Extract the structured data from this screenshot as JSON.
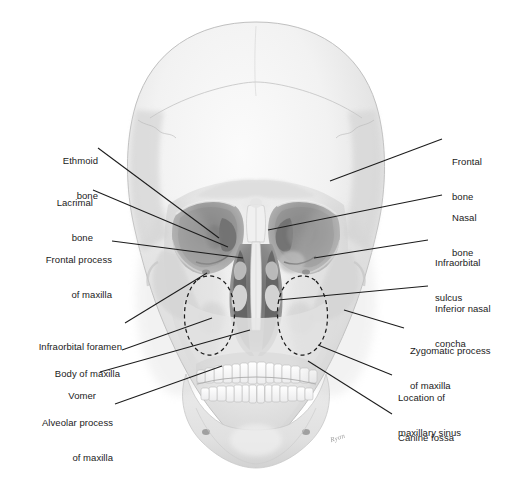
{
  "figure": {
    "background_color": "#ffffff",
    "text_color": "#1a1a1a",
    "leader_line_color": "#1c1c1c",
    "sinus_outline_color": "#1b1b1b",
    "sinus_outline_style": "dashed",
    "artist_signature": "Ryan"
  },
  "labels_left": [
    {
      "id": "ethmoid-bone",
      "lines": [
        "Ethmoid",
        "bone"
      ]
    },
    {
      "id": "lacrimal-bone",
      "lines": [
        "Lacrimal",
        "bone"
      ]
    },
    {
      "id": "frontal-process-maxilla",
      "lines": [
        "Frontal process",
        "of maxilla"
      ]
    },
    {
      "id": "infraorbital-foramen",
      "lines": [
        "Infraorbital foramen"
      ]
    },
    {
      "id": "body-of-maxilla",
      "lines": [
        "Body of maxilla"
      ]
    },
    {
      "id": "vomer",
      "lines": [
        "Vomer"
      ]
    },
    {
      "id": "alveolar-process-maxilla",
      "lines": [
        "Alveolar process",
        "of maxilla"
      ]
    }
  ],
  "labels_right": [
    {
      "id": "frontal-bone",
      "lines": [
        "Frontal",
        "bone"
      ]
    },
    {
      "id": "nasal-bone",
      "lines": [
        "Nasal",
        "bone"
      ]
    },
    {
      "id": "infraorbital-sulcus",
      "lines": [
        "Infraorbital",
        "sulcus"
      ]
    },
    {
      "id": "inferior-nasal-concha",
      "lines": [
        "Inferior nasal",
        "concha"
      ]
    },
    {
      "id": "zygomatic-process-maxilla",
      "lines": [
        "Zygomatic process",
        "of maxilla"
      ]
    },
    {
      "id": "location-maxillary-sinus",
      "lines": [
        "Location of",
        "maxillary sinus"
      ]
    },
    {
      "id": "canine-fossa",
      "lines": [
        "Canine fossa"
      ]
    }
  ]
}
